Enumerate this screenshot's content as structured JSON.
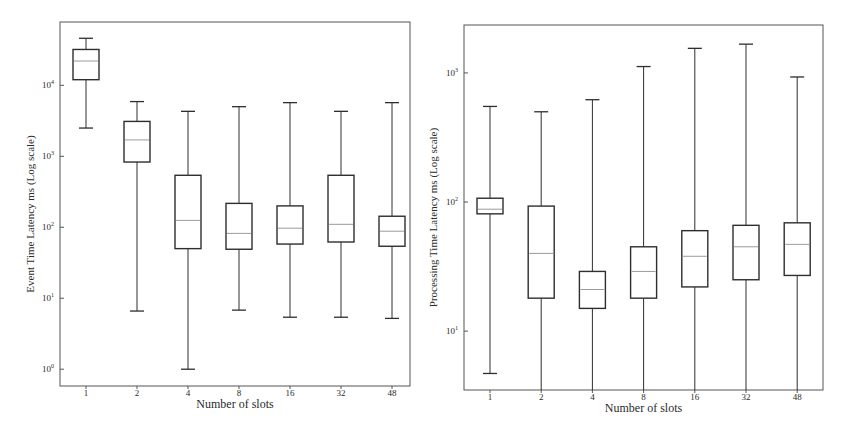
{
  "chart_data": [
    {
      "type": "boxplot",
      "title": "",
      "xlabel": "Number of slots",
      "ylabel": "Event Time Latency ms (Log scale)",
      "yscale": "log",
      "ylim": [
        0.58,
        78000
      ],
      "yticks": [
        {
          "label": "10^0",
          "base": "10",
          "exp": "0",
          "value": 1
        },
        {
          "label": "10^1",
          "base": "10",
          "exp": "1",
          "value": 10
        },
        {
          "label": "10^2",
          "base": "10",
          "exp": "2",
          "value": 100
        },
        {
          "label": "10^3",
          "base": "10",
          "exp": "3",
          "value": 1000
        },
        {
          "label": "10^4",
          "base": "10",
          "exp": "4",
          "value": 10000
        }
      ],
      "grid": false,
      "categories": [
        "1",
        "2",
        "4",
        "8",
        "16",
        "32",
        "48"
      ],
      "boxes": [
        {
          "category": "1",
          "whisker_low": 2500,
          "q1": 12000,
          "median": 22000,
          "q3": 32000,
          "whisker_high": 46000
        },
        {
          "category": "2",
          "whisker_low": 6.6,
          "q1": 830,
          "median": 1700,
          "q3": 3100,
          "whisker_high": 5900
        },
        {
          "category": "4",
          "whisker_low": 1.0,
          "q1": 50,
          "median": 125,
          "q3": 540,
          "whisker_high": 4300
        },
        {
          "category": "8",
          "whisker_low": 6.8,
          "q1": 49,
          "median": 82,
          "q3": 217,
          "whisker_high": 5000
        },
        {
          "category": "16",
          "whisker_low": 5.4,
          "q1": 58,
          "median": 97,
          "q3": 200,
          "whisker_high": 5700
        },
        {
          "category": "32",
          "whisker_low": 5.4,
          "q1": 62,
          "median": 110,
          "q3": 540,
          "whisker_high": 4300
        },
        {
          "category": "48",
          "whisker_low": 5.2,
          "q1": 54,
          "median": 88,
          "q3": 143,
          "whisker_high": 5700
        }
      ]
    },
    {
      "type": "boxplot",
      "title": "",
      "xlabel": "Number of slots",
      "ylabel": "Processing Time Latency ms (Log scale)",
      "yscale": "log",
      "ylim": [
        3.5,
        2350
      ],
      "yticks": [
        {
          "label": "10^1",
          "base": "10",
          "exp": "1",
          "value": 10
        },
        {
          "label": "10^2",
          "base": "10",
          "exp": "2",
          "value": 100
        },
        {
          "label": "10^3",
          "base": "10",
          "exp": "3",
          "value": 1000
        }
      ],
      "grid": false,
      "categories": [
        "1",
        "2",
        "4",
        "8",
        "16",
        "32",
        "48"
      ],
      "boxes": [
        {
          "category": "1",
          "whisker_low": 4.7,
          "q1": 81,
          "median": 88,
          "q3": 107,
          "whisker_high": 550
        },
        {
          "category": "2",
          "whisker_low": 3.5,
          "q1": 18,
          "median": 40,
          "q3": 93,
          "whisker_high": 500
        },
        {
          "category": "4",
          "whisker_low": 3.5,
          "q1": 15,
          "median": 21,
          "q3": 29,
          "whisker_high": 620
        },
        {
          "category": "8",
          "whisker_low": 3.5,
          "q1": 18,
          "median": 29,
          "q3": 45,
          "whisker_high": 1120
        },
        {
          "category": "16",
          "whisker_low": 3.5,
          "q1": 22,
          "median": 38,
          "q3": 60,
          "whisker_high": 1550
        },
        {
          "category": "32",
          "whisker_low": 3.5,
          "q1": 25,
          "median": 45,
          "q3": 66,
          "whisker_high": 1670
        },
        {
          "category": "48",
          "whisker_low": 3.5,
          "q1": 27,
          "median": 47,
          "q3": 69,
          "whisker_high": 930
        }
      ]
    }
  ],
  "colors": {
    "box_edge": "#2e2e2e",
    "median_line": "#9a9a9a",
    "frame": "#555555",
    "text": "#2a2a2a"
  }
}
